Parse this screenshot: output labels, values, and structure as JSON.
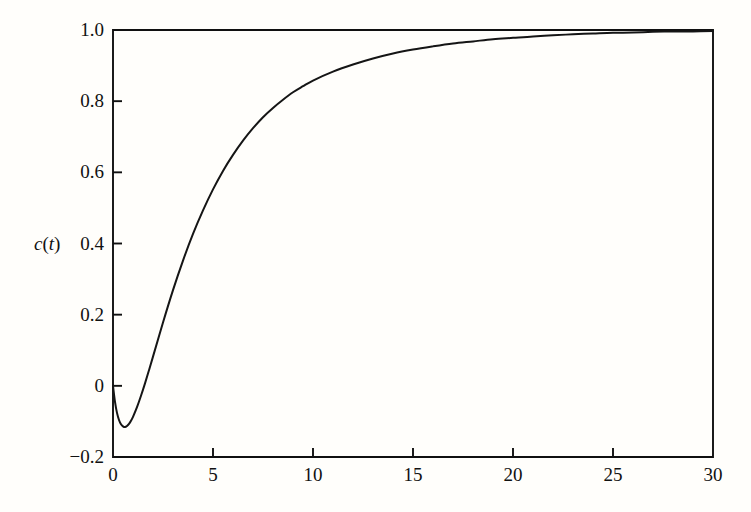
{
  "figure": {
    "background_color": "#fffefb",
    "line_color": "#151515",
    "axis_color": "#101010"
  },
  "axis_label": {
    "full": "c(t)",
    "variable": "c",
    "open_paren": "(",
    "argument": "t",
    "close_paren": ")"
  },
  "chart_data": {
    "type": "line",
    "title": "",
    "subtitle": "",
    "xlabel": "",
    "ylabel": "c(t)",
    "xlim": [
      0,
      30
    ],
    "ylim": [
      -0.2,
      1.0
    ],
    "grid": false,
    "legend": null,
    "xticks": [
      0,
      5,
      10,
      15,
      20,
      25,
      30
    ],
    "xtick_labels": [
      "0",
      "5",
      "10",
      "15",
      "20",
      "25",
      "30"
    ],
    "yticks": [
      -0.2,
      0,
      0.2,
      0.4,
      0.6,
      0.8,
      1.0
    ],
    "ytick_labels": [
      "-0.2",
      "0",
      "0.2",
      "0.4",
      "0.6",
      "0.8",
      "1.0"
    ],
    "tick_direction": "in",
    "annotations": [],
    "series": [
      {
        "name": "c(t)",
        "color": "#151515",
        "line_width": 2,
        "x": [
          0,
          0.1,
          0.2,
          0.3,
          0.4,
          0.5,
          0.6,
          0.7,
          0.8,
          0.9,
          1.0,
          1.2,
          1.4,
          1.6,
          1.8,
          2.0,
          2.5,
          3.0,
          3.5,
          4.0,
          4.5,
          5.0,
          5.5,
          6.0,
          6.5,
          7.0,
          7.5,
          8.0,
          8.5,
          9.0,
          9.5,
          10.0,
          11.0,
          12.0,
          13.0,
          14.0,
          15.0,
          16.0,
          17.0,
          18.0,
          19.0,
          20.0,
          21.0,
          22.0,
          23.0,
          24.0,
          25.0,
          26.0,
          27.0,
          28.0,
          29.0,
          30.0
        ],
        "y": [
          0.0,
          -0.045,
          -0.076,
          -0.096,
          -0.108,
          -0.114,
          -0.116,
          -0.113,
          -0.107,
          -0.098,
          -0.087,
          -0.06,
          -0.028,
          0.007,
          0.044,
          0.082,
          0.178,
          0.269,
          0.352,
          0.427,
          0.493,
          0.552,
          0.604,
          0.649,
          0.689,
          0.724,
          0.755,
          0.781,
          0.804,
          0.825,
          0.842,
          0.858,
          0.883,
          0.903,
          0.92,
          0.934,
          0.945,
          0.954,
          0.962,
          0.968,
          0.974,
          0.978,
          0.982,
          0.985,
          0.988,
          0.99,
          0.992,
          0.993,
          0.995,
          0.996,
          0.996,
          0.997
        ]
      }
    ],
    "notable_points": {
      "start": {
        "t": 0,
        "value": 0.0
      },
      "minimum": {
        "t": 0.6,
        "value": -0.116
      },
      "zero_crossing": {
        "t": 1.55,
        "value": 0.0
      },
      "at_t10": {
        "t": 10,
        "value": 0.86
      },
      "asymptote": {
        "t": 30,
        "value": 1.0
      }
    }
  }
}
